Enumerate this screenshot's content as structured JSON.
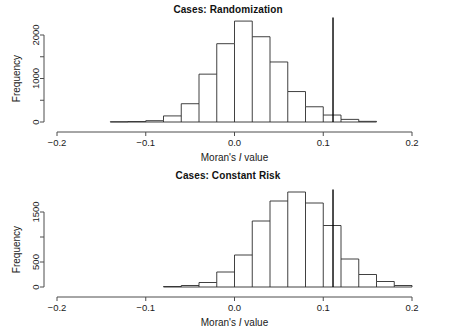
{
  "figure": {
    "panels": [
      {
        "id": "panel-randomization",
        "title": "Cases: Randomization",
        "xlabel_pre": "Moran's ",
        "xlabel_italic": "I",
        "xlabel_post": " value",
        "ylabel": "Frequency"
      },
      {
        "id": "panel-constant-risk",
        "title": "Cases: Constant Risk",
        "xlabel_pre": "Moran's ",
        "xlabel_italic": "I",
        "xlabel_post": " value",
        "ylabel": "Frequency"
      }
    ]
  },
  "chart_data": [
    {
      "type": "bar",
      "title": "Cases: Randomization",
      "subtitle": "",
      "xlabel": "Moran's I value",
      "ylabel": "Frequency",
      "grid": false,
      "legend": null,
      "xlim": [
        -0.2,
        0.2
      ],
      "ylim": [
        0,
        2400
      ],
      "xticks": [
        -0.2,
        -0.1,
        0.0,
        0.1,
        0.2
      ],
      "xtick_labels": [
        "−0.2",
        "−0.1",
        "0.0",
        "0.1",
        "0.2"
      ],
      "yticks": [
        0,
        1000,
        2000
      ],
      "ytick_labels": [
        "0",
        "1000",
        "2000"
      ],
      "ytick_minor": [
        500,
        1500
      ],
      "bin_width": 0.02,
      "bin_edges": [
        -0.14,
        -0.12,
        -0.1,
        -0.08,
        -0.06,
        -0.04,
        -0.02,
        0.0,
        0.02,
        0.04,
        0.06,
        0.08,
        0.1,
        0.12,
        0.14,
        0.16
      ],
      "bin_centers": [
        -0.13,
        -0.11,
        -0.09,
        -0.07,
        -0.05,
        -0.03,
        -0.01,
        0.01,
        0.03,
        0.05,
        0.07,
        0.09,
        0.11,
        0.13,
        0.15
      ],
      "values": [
        5,
        10,
        30,
        140,
        420,
        1100,
        1800,
        2320,
        1960,
        1380,
        700,
        350,
        160,
        60,
        15
      ],
      "annotations": [
        {
          "type": "vline",
          "name": "observed-moran-i",
          "x": 0.111,
          "y_top": 2400,
          "color": "#000000",
          "label": "Observed Moran's I"
        }
      ]
    },
    {
      "type": "bar",
      "title": "Cases: Constant Risk",
      "subtitle": "",
      "xlabel": "Moran's I value",
      "ylabel": "Frequency",
      "grid": false,
      "legend": null,
      "xlim": [
        -0.2,
        0.2
      ],
      "ylim": [
        0,
        1950
      ],
      "xticks": [
        -0.2,
        -0.1,
        0.0,
        0.1,
        0.2
      ],
      "xtick_labels": [
        "−0.2",
        "−0.1",
        "0.0",
        "0.1",
        "0.2"
      ],
      "yticks": [
        0,
        500,
        1500
      ],
      "ytick_labels": [
        "0",
        "500",
        "1500"
      ],
      "ytick_minor": [
        1000
      ],
      "bin_width": 0.02,
      "bin_edges": [
        -0.08,
        -0.06,
        -0.04,
        -0.02,
        0.0,
        0.02,
        0.04,
        0.06,
        0.08,
        0.1,
        0.12,
        0.14,
        0.16,
        0.18,
        0.2
      ],
      "bin_centers": [
        -0.07,
        -0.05,
        -0.03,
        -0.01,
        0.01,
        0.03,
        0.05,
        0.07,
        0.09,
        0.11,
        0.13,
        0.15,
        0.17,
        0.19
      ],
      "values": [
        10,
        30,
        90,
        300,
        640,
        1320,
        1720,
        1900,
        1680,
        1230,
        560,
        250,
        110,
        30
      ],
      "annotations": [
        {
          "type": "vline",
          "name": "observed-moran-i",
          "x": 0.111,
          "y_top": 1950,
          "color": "#000000",
          "label": "Observed Moran's I"
        }
      ]
    }
  ]
}
